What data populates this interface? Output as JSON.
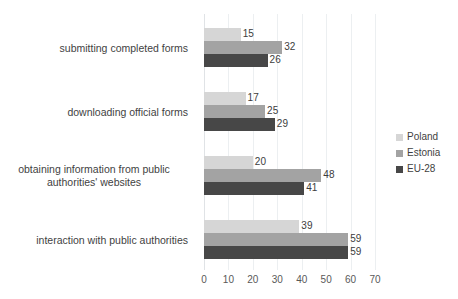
{
  "chart_data": {
    "type": "bar",
    "orientation": "horizontal",
    "title": "",
    "subtitle": "",
    "xlabel": "",
    "ylabel": "",
    "xlim": [
      0,
      70
    ],
    "xticks": [
      "0",
      "10",
      "20",
      "30",
      "40",
      "50",
      "60",
      "70"
    ],
    "grid": true,
    "grid_axis": "x",
    "legend_position": "right",
    "categories": [
      "submitting completed forms",
      "downloading official forms",
      "obtaining information from public authorities' websites",
      "interaction with public authorities"
    ],
    "category_lines": [
      [
        "submitting completed forms"
      ],
      [
        "downloading official forms"
      ],
      [
        "obtaining information from public",
        "authorities' websites"
      ],
      [
        "interaction with public authorities"
      ]
    ],
    "series": [
      {
        "name": "Poland",
        "color": "#d6d6d6",
        "values": [
          15,
          17,
          20,
          39
        ]
      },
      {
        "name": "Estonia",
        "color": "#a3a3a3",
        "values": [
          32,
          25,
          48,
          59
        ]
      },
      {
        "name": "EU-28",
        "color": "#474747",
        "values": [
          26,
          29,
          41,
          59
        ]
      }
    ]
  },
  "legend": {
    "items": [
      {
        "label": "Poland",
        "color": "#d6d6d6"
      },
      {
        "label": "Estonia",
        "color": "#a3a3a3"
      },
      {
        "label": "EU-28",
        "color": "#474747"
      }
    ]
  }
}
